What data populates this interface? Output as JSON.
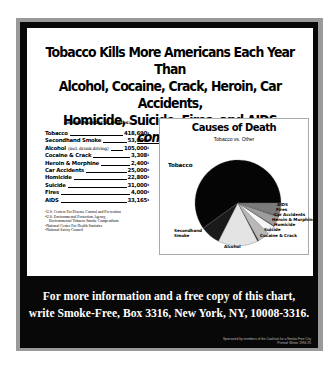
{
  "headline": {
    "line1": "Tobacco Kills More Americans Each Year Than",
    "line2": "Alcohol, Cocaine, Crack, Heroin, Car Accidents,",
    "line3_prefix": "Homicide, Suicide, Fires, and AIDS ",
    "line3_emphasis": "combined."
  },
  "deaths_list": {
    "heading": "Annual Number of Deaths:",
    "rows": [
      {
        "name": "Tobacco",
        "note": "",
        "value": "418,690",
        "ref": "1"
      },
      {
        "name": "Secondhand Smoke",
        "note": "",
        "value": "53,000",
        "ref": "2"
      },
      {
        "name": "Alcohol",
        "note": "(incl. drunk driving)",
        "value": "105,000",
        "ref": "1"
      },
      {
        "name": "Cocaine & Crack",
        "note": "",
        "value": "3,308",
        "ref": "1"
      },
      {
        "name": "Heroin & Morphine",
        "note": "",
        "value": "2,400",
        "ref": "1"
      },
      {
        "name": "Car Accidents",
        "note": "",
        "value": "25,000",
        "ref": "4"
      },
      {
        "name": "Homicide",
        "note": "",
        "value": "22,800",
        "ref": "3"
      },
      {
        "name": "Suicide",
        "note": "",
        "value": "31,000",
        "ref": "3"
      },
      {
        "name": "Fires",
        "note": "",
        "value": "4,000",
        "ref": "4"
      },
      {
        "name": "AIDS",
        "note": "",
        "value": "33,165",
        "ref": "3"
      }
    ],
    "footnotes": [
      "¹U.S. Centers For Disease Control and Prevention",
      "²U.S. Environmental Protection Agency,",
      "Environmental Tobacco Smoke Compendium",
      "³National Center For Health Statistics",
      "⁴National Safety Council"
    ]
  },
  "chart_data": {
    "type": "pie",
    "title": "Causes of Death",
    "subtitle": "Tobacco vs. Other",
    "categories": [
      "Tobacco",
      "Secondhand Smoke",
      "Alcohol",
      "Cocaine & Crack",
      "Suicide",
      "Homicide",
      "Heroin & Morphine",
      "Car Accidents",
      "Fires",
      "AIDS"
    ],
    "values": [
      418690,
      53000,
      105000,
      3308,
      31000,
      22800,
      2400,
      25000,
      4000,
      33165
    ],
    "colors": [
      "#050505",
      "#1a1a1a",
      "#e4e4e4",
      "#222222",
      "#b8b8b8",
      "#f6f6f6",
      "#333333",
      "#9c9c9c",
      "#4a4a4a",
      "#7a7a7a"
    ],
    "legend_position": "labels beside slices"
  },
  "footer": {
    "line1": "For more information and a free copy of this chart,",
    "line2": "write Smoke-Free, Box 3316, New York, NY, 10008-3316.",
    "sponsor1": "Sponsored by members of the Coalition for a Smoke-Free City",
    "sponsor2": "Printed: Winter 1994-95"
  }
}
